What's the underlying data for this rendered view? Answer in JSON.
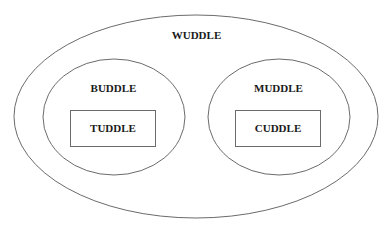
{
  "diagram": {
    "caption_cropped": "",
    "colors": {
      "background": "#ffffff",
      "stroke": "#6b6b6b",
      "text": "#1a1a1a"
    },
    "outer": {
      "label": "WUDDLE",
      "shape": "ellipse",
      "children": [
        "BUDDLE",
        "MUDDLE"
      ]
    },
    "groups": [
      {
        "label": "BUDDLE",
        "shape": "ellipse",
        "child": {
          "label": "TUDDLE",
          "shape": "rectangle"
        }
      },
      {
        "label": "MUDDLE",
        "shape": "ellipse",
        "child": {
          "label": "CUDDLE",
          "shape": "rectangle"
        }
      }
    ]
  }
}
